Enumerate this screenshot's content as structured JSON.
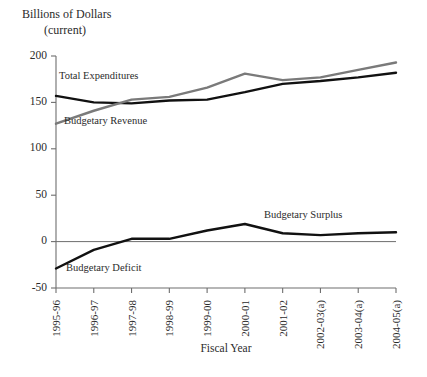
{
  "chart_data": {
    "type": "line",
    "title": "Billions of Dollars",
    "subtitle": "(current)",
    "xlabel": "Fiscal Year",
    "ylabel": "",
    "categories": [
      "1995-96",
      "1996-97",
      "1997-98",
      "1998-99",
      "1999-00",
      "2000-01",
      "2001-02",
      "2002-03(a)",
      "2003-04(a)",
      "2004-05(a)"
    ],
    "yticks": [
      -50,
      0,
      50,
      100,
      150,
      200
    ],
    "ylim": [
      -50,
      200
    ],
    "grid": false,
    "legend_position": "inline-annotations",
    "series": [
      {
        "name": "Total Expenditures",
        "color": "#111111",
        "values": [
          157,
          150,
          149,
          152,
          153,
          161,
          170,
          173,
          177,
          182
        ]
      },
      {
        "name": "Budgetary Revenue",
        "color": "#7a7a7a",
        "values": [
          127,
          141,
          153,
          156,
          166,
          181,
          174,
          177,
          185,
          193
        ]
      },
      {
        "name": "Budgetary Surplus",
        "color": "#111111",
        "values": [
          -29,
          -9,
          3,
          3,
          12,
          19,
          9,
          7,
          9,
          10
        ]
      }
    ],
    "annotations": [
      {
        "text": "Total Expenditures",
        "x": 59,
        "y": 79
      },
      {
        "text": "Budgetary Revenue",
        "x": 64,
        "y": 124
      },
      {
        "text": "Budgetary Surplus",
        "x": 264,
        "y": 218
      },
      {
        "text": "Budgetary Deficit",
        "x": 66,
        "y": 271
      }
    ]
  }
}
